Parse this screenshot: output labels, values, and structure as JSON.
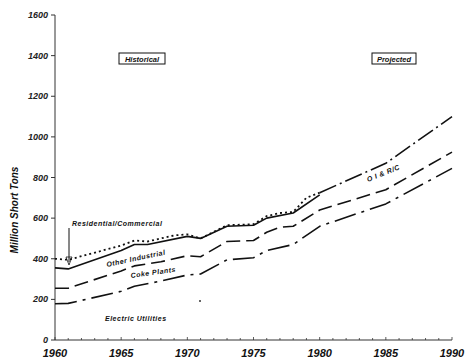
{
  "chart_data": {
    "type": "line",
    "title": "",
    "xlabel": "",
    "ylabel": "Million Short Tons",
    "xlim": [
      1960,
      1990
    ],
    "ylim": [
      0,
      1600
    ],
    "x_ticks": [
      1960,
      1965,
      1970,
      1975,
      1980,
      1985,
      1990
    ],
    "y_ticks": [
      0,
      200,
      400,
      600,
      800,
      1000,
      1200,
      1400,
      1600
    ],
    "grid": false,
    "annotations": [
      {
        "text": "Historical",
        "boxed": true,
        "x": 1966,
        "y": 1380
      },
      {
        "text": "Projected",
        "boxed": true,
        "x": 1986,
        "y": 1380
      },
      {
        "text": "Residential/Commercial",
        "x": 1961,
        "y": 590,
        "arrow_to": [
          1961,
          395
        ]
      },
      {
        "text": "Other Industrial",
        "x": 1965,
        "y": 400
      },
      {
        "text": "Coke Plants",
        "x": 1967,
        "y": 330
      },
      {
        "text": "Electric Utilities",
        "x": 1964,
        "y": 100
      },
      {
        "text": "O I & R/C",
        "x": 1983,
        "y": 860
      }
    ],
    "series": [
      {
        "name": "Residential/Commercial (cumulative total)",
        "style": "dash-dot (projected), dotted (historical)",
        "x": [
          1960,
          1961,
          1965,
          1966,
          1967,
          1969,
          1970,
          1971,
          1973,
          1975,
          1976,
          1977,
          1978,
          1979,
          1980,
          1985,
          1990
        ],
        "values": [
          400,
          395,
          465,
          490,
          485,
          515,
          520,
          500,
          565,
          570,
          610,
          625,
          630,
          700,
          725,
          870,
          1100
        ]
      },
      {
        "name": "Other Industrial (cumulative)",
        "style": "solid",
        "x": [
          1960,
          1961,
          1965,
          1966,
          1967,
          1970,
          1971,
          1973,
          1975,
          1976,
          1978,
          1980
        ],
        "values": [
          355,
          350,
          440,
          470,
          470,
          510,
          500,
          560,
          565,
          600,
          625,
          715
        ]
      },
      {
        "name": "Coke Plants (cumulative)",
        "style": "long dash",
        "x": [
          1960,
          1961,
          1965,
          1966,
          1968,
          1970,
          1971,
          1973,
          1975,
          1976,
          1977,
          1978,
          1980,
          1985,
          1990
        ],
        "values": [
          255,
          255,
          340,
          365,
          385,
          415,
          410,
          485,
          490,
          530,
          555,
          560,
          640,
          740,
          925
        ]
      },
      {
        "name": "Electric Utilities",
        "style": "dash-dot",
        "x": [
          1960,
          1961,
          1965,
          1966,
          1968,
          1970,
          1971,
          1973,
          1975,
          1976,
          1978,
          1980,
          1985,
          1990
        ],
        "values": [
          178,
          180,
          240,
          265,
          290,
          320,
          325,
          395,
          405,
          440,
          470,
          560,
          670,
          845
        ]
      }
    ]
  },
  "labels": {
    "ylabel": "Million Short Tons",
    "historical": "Historical",
    "projected": "Projected",
    "res_comm": "Residential/Commercial",
    "other_ind": "Other Industrial",
    "coke": "Coke Plants",
    "electric": "Electric Utilities",
    "oi_rc": "O I & R/C"
  }
}
